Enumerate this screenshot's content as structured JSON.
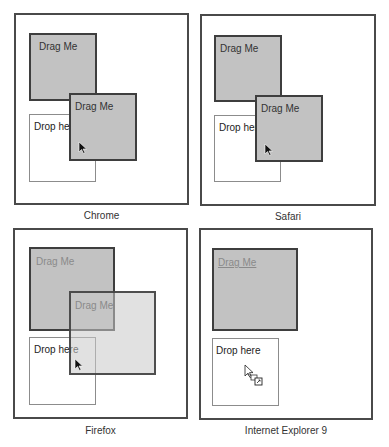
{
  "panels": [
    {
      "id": "chrome",
      "caption": "Chrome",
      "drag_source_label": "Drag Me",
      "drag_image_label": "Drag Me",
      "drop_target_label": "Drop here"
    },
    {
      "id": "safari",
      "caption": "Safari",
      "drag_source_label": "Drag Me",
      "drag_image_label": "Drag Me",
      "drop_target_label": "Drop here"
    },
    {
      "id": "firefox",
      "caption": "Firefox",
      "drag_source_label": "Drag Me",
      "drag_image_label": "Drag Me",
      "drop_target_label": "Drop here"
    },
    {
      "id": "ie9",
      "caption": "Internet Explorer 9",
      "drag_source_label": "Drag Me",
      "drop_target_label": "Drop here"
    }
  ],
  "icons": {
    "cursor": "arrow-pointer-icon",
    "ie_cursor": "copy-drag-cursor-icon"
  },
  "colors": {
    "frame_border": "#4a4a4a",
    "drag_box_fill": "#c2c2c2",
    "drag_box_border": "#3e3e3e",
    "drop_border": "#8c8c8c"
  }
}
